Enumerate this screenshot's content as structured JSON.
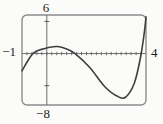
{
  "figure": {
    "labels": {
      "ymax": "6",
      "xmin": "−1",
      "xmax": "4",
      "ymin": "−8"
    }
  },
  "chart_data": {
    "type": "line",
    "title": "",
    "xlabel": "",
    "ylabel": "",
    "xlim": [
      -1,
      4
    ],
    "ylim": [
      -8,
      6
    ],
    "x_tick_step": 0.2,
    "y_tick_values": [
      -5,
      5
    ],
    "grid": false,
    "legend": false,
    "frame_style": "rounded viewing-window box",
    "axis_edge_labels": {
      "ymax": "6",
      "xmin": "−1",
      "xmax": "4",
      "ymin": "−8"
    },
    "series": [
      {
        "name": "cubic-like curve",
        "points": [
          [
            -1.0,
            -2.7
          ],
          [
            -0.56,
            0.0
          ],
          [
            -0.07,
            0.8
          ],
          [
            0.41,
            1.1
          ],
          [
            0.85,
            0.64
          ],
          [
            1.14,
            0.0
          ],
          [
            1.74,
            -2.2
          ],
          [
            2.35,
            -5.2
          ],
          [
            2.87,
            -6.7
          ],
          [
            3.19,
            -6.75
          ],
          [
            3.52,
            -4.7
          ],
          [
            3.76,
            -1.0
          ],
          [
            3.92,
            2.9
          ],
          [
            4.0,
            5.7
          ]
        ]
      }
    ],
    "colors": {
      "curve": "#3f3f3f",
      "frame": "#8c8c8c",
      "axis": "#6e6e6e",
      "tick": "#5a5a5a",
      "text": "#1c1c1c"
    }
  }
}
